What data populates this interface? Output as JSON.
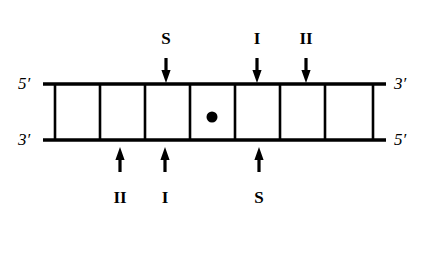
{
  "figure": {
    "kind": "dna-duplex-restriction-map",
    "stroke_color": "#000000",
    "background_color": "#ffffff",
    "duplex": {
      "left_x": 43,
      "right_x": 386,
      "top_strand_y": 84,
      "bottom_strand_y": 140,
      "strand_thickness": 3.5,
      "rung_thickness": 2.6,
      "rung_positions": [
        55,
        100,
        145,
        190,
        235,
        280,
        325,
        373
      ],
      "cell_count": 7
    },
    "center_marker": {
      "name": "center-dot",
      "x": 212,
      "y": 117,
      "radius": 5.5,
      "color": "#000000"
    },
    "end_labels": {
      "top_left": "5′",
      "bottom_left": "3′",
      "top_right": "3′",
      "bottom_right": "5′"
    },
    "top_sites": [
      {
        "label": "S",
        "arrow_x": 166,
        "label_x": 166,
        "label_y": 30,
        "arrow_top_y": 58,
        "arrow_tip_y": 83
      },
      {
        "label": "I",
        "arrow_x": 257,
        "label_x": 257,
        "label_y": 30,
        "arrow_top_y": 58,
        "arrow_tip_y": 83
      },
      {
        "label": "II",
        "arrow_x": 306,
        "label_x": 306,
        "label_y": 30,
        "arrow_top_y": 58,
        "arrow_tip_y": 83
      }
    ],
    "bottom_sites": [
      {
        "label": "II",
        "arrow_x": 120,
        "label_x": 120,
        "label_y": 189,
        "arrow_bottom_y": 172,
        "arrow_tip_y": 147
      },
      {
        "label": "I",
        "arrow_x": 165,
        "label_x": 165,
        "label_y": 189,
        "arrow_bottom_y": 172,
        "arrow_tip_y": 147
      },
      {
        "label": "S",
        "arrow_x": 259,
        "label_x": 259,
        "label_y": 189,
        "arrow_bottom_y": 172,
        "arrow_tip_y": 147
      }
    ]
  }
}
